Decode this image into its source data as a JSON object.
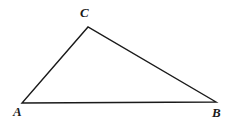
{
  "figure": {
    "type": "geometry-diagram",
    "shape": "triangle",
    "background_color": "#ffffff",
    "stroke_color": "#1a1a1a",
    "stroke_width": 1.4,
    "canvas": {
      "width": 233,
      "height": 127
    },
    "vertices": [
      {
        "name": "A",
        "label": "A",
        "x": 22,
        "y": 103,
        "label_x": 13,
        "label_y": 105
      },
      {
        "name": "B",
        "label": "B",
        "x": 216,
        "y": 102,
        "label_x": 212,
        "label_y": 106
      },
      {
        "name": "C",
        "label": "C",
        "x": 88,
        "y": 27,
        "label_x": 80,
        "label_y": 6
      }
    ],
    "edges": [
      {
        "name": "AC",
        "from": "A",
        "to": "C"
      },
      {
        "name": "CB",
        "from": "C",
        "to": "B"
      },
      {
        "name": "AB",
        "from": "A",
        "to": "B"
      }
    ],
    "path": "M 22 103 L 88 27 L 216 102 Z"
  }
}
